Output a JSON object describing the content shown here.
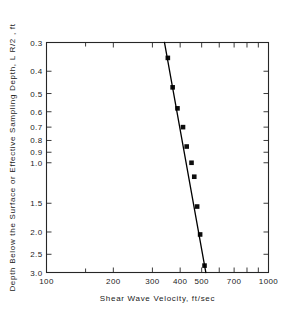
{
  "chart_data": {
    "type": "scatter",
    "title": "",
    "xlabel": "Shear Wave Velocity, ft/sec",
    "ylabel": "Depth Below the Surface or Effective Sampling Depth, L R/2 , ft",
    "xscale": "log",
    "yscale": "log",
    "xlim": [
      100,
      1000
    ],
    "ylim": [
      0.3,
      3.0
    ],
    "y_inverted": true,
    "grid": false,
    "legend": "none",
    "x_ticklabels": [
      "100",
      "200",
      "300",
      "400",
      "500",
      "700",
      "1000"
    ],
    "x_ticklabel_values": [
      100,
      200,
      300,
      400,
      500,
      700,
      1000
    ],
    "x_minor_ticks": [
      100,
      200,
      300,
      400,
      500,
      600,
      700,
      800,
      900,
      1000
    ],
    "y_ticklabels": [
      "0.3",
      "0.4",
      "0.5",
      "0.6",
      "0.7",
      "0.8",
      "0.9",
      "1.0",
      "1.5",
      "2.0",
      "2.5",
      "3.0"
    ],
    "y_ticklabel_values": [
      0.3,
      0.4,
      0.5,
      0.6,
      0.7,
      0.8,
      0.9,
      1.0,
      1.5,
      2.0,
      2.5,
      3.0
    ],
    "series": [
      {
        "name": "Measured points",
        "marker": "filled-square",
        "x": [
          352,
          370,
          389,
          412,
          428,
          450,
          463,
          477,
          492,
          515
        ],
        "y": [
          0.35,
          0.47,
          0.58,
          0.7,
          0.85,
          1.0,
          1.15,
          1.55,
          2.05,
          2.8
        ]
      },
      {
        "name": "Best fit line",
        "marker": "none",
        "line": true,
        "x": [
          340,
          522
        ],
        "y": [
          0.3,
          3.0
        ]
      }
    ]
  },
  "axes": {
    "x_title": "Shear Wave Velocity, ft/sec",
    "y_title": "Depth Below the Surface or Effective Sampling Depth, L R/2 , ft"
  }
}
